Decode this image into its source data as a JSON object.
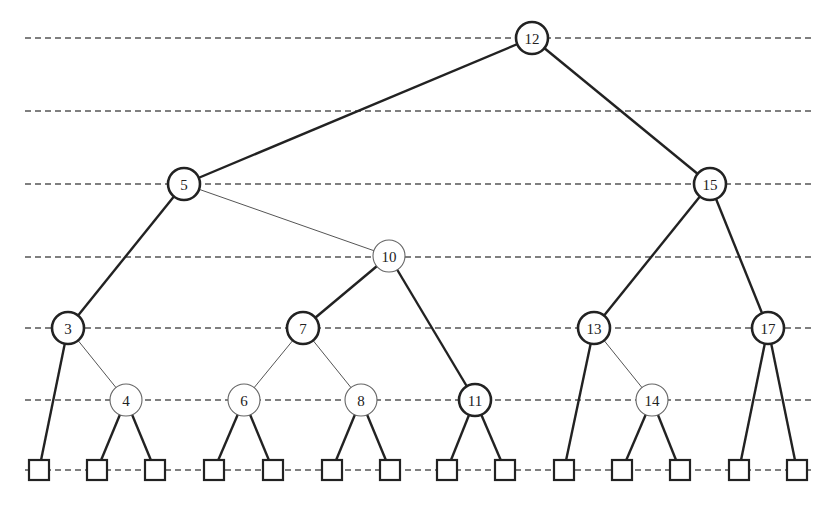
{
  "diagram": {
    "type": "red-black-tree",
    "level_lines_y": [
      38,
      111,
      184,
      257,
      328,
      400,
      470
    ],
    "level_line_x_range": [
      25,
      815
    ],
    "node_radius": 16,
    "leaf_size": 20,
    "nodes": [
      {
        "id": "12",
        "label": "12",
        "color": "black",
        "x": 532,
        "y": 38
      },
      {
        "id": "5",
        "label": "5",
        "color": "black",
        "x": 184,
        "y": 184
      },
      {
        "id": "15",
        "label": "15",
        "color": "black",
        "x": 710,
        "y": 184
      },
      {
        "id": "10",
        "label": "10",
        "color": "red",
        "x": 389,
        "y": 256
      },
      {
        "id": "3",
        "label": "3",
        "color": "black",
        "x": 68,
        "y": 328
      },
      {
        "id": "7",
        "label": "7",
        "color": "black",
        "x": 303,
        "y": 328
      },
      {
        "id": "13",
        "label": "13",
        "color": "black",
        "x": 594,
        "y": 328
      },
      {
        "id": "17",
        "label": "17",
        "color": "black",
        "x": 768,
        "y": 328
      },
      {
        "id": "4",
        "label": "4",
        "color": "red",
        "x": 126,
        "y": 400
      },
      {
        "id": "6",
        "label": "6",
        "color": "red",
        "x": 244,
        "y": 400
      },
      {
        "id": "8",
        "label": "8",
        "color": "red",
        "x": 361,
        "y": 400
      },
      {
        "id": "11",
        "label": "11",
        "color": "black",
        "x": 475,
        "y": 400
      },
      {
        "id": "14",
        "label": "14",
        "color": "red",
        "x": 652,
        "y": 400
      }
    ],
    "leaves": [
      {
        "id": "L1",
        "x": 39,
        "y": 470
      },
      {
        "id": "L2",
        "x": 97,
        "y": 470
      },
      {
        "id": "L3",
        "x": 155,
        "y": 470
      },
      {
        "id": "L4",
        "x": 214,
        "y": 470
      },
      {
        "id": "L5",
        "x": 273,
        "y": 470
      },
      {
        "id": "L6",
        "x": 332,
        "y": 470
      },
      {
        "id": "L7",
        "x": 390,
        "y": 470
      },
      {
        "id": "L8",
        "x": 447,
        "y": 470
      },
      {
        "id": "L9",
        "x": 505,
        "y": 470
      },
      {
        "id": "L10",
        "x": 564,
        "y": 470
      },
      {
        "id": "L11",
        "x": 622,
        "y": 470
      },
      {
        "id": "L12",
        "x": 680,
        "y": 470
      },
      {
        "id": "L13",
        "x": 739,
        "y": 470
      },
      {
        "id": "L14",
        "x": 797,
        "y": 470
      }
    ],
    "edges": [
      [
        "12",
        "5"
      ],
      [
        "12",
        "15"
      ],
      [
        "5",
        "3"
      ],
      [
        "5",
        "10"
      ],
      [
        "10",
        "7"
      ],
      [
        "10",
        "11"
      ],
      [
        "15",
        "13"
      ],
      [
        "15",
        "17"
      ],
      [
        "3",
        "L1"
      ],
      [
        "3",
        "4"
      ],
      [
        "4",
        "L2"
      ],
      [
        "4",
        "L3"
      ],
      [
        "7",
        "6"
      ],
      [
        "7",
        "8"
      ],
      [
        "6",
        "L4"
      ],
      [
        "6",
        "L5"
      ],
      [
        "8",
        "L6"
      ],
      [
        "8",
        "L7"
      ],
      [
        "11",
        "L8"
      ],
      [
        "11",
        "L9"
      ],
      [
        "13",
        "L10"
      ],
      [
        "13",
        "14"
      ],
      [
        "14",
        "L11"
      ],
      [
        "14",
        "L12"
      ],
      [
        "17",
        "L13"
      ],
      [
        "17",
        "L14"
      ]
    ],
    "colors": {
      "black_stroke": "#222222",
      "red_stroke": "#666666",
      "level_line": "#555555"
    }
  }
}
